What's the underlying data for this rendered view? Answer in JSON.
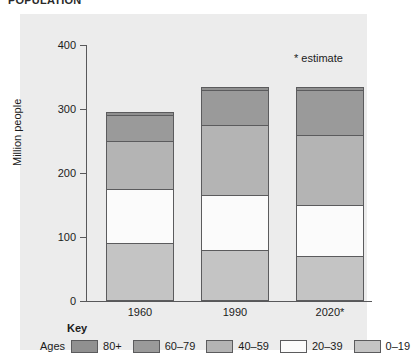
{
  "caption": "POPULATION",
  "chart_data": {
    "type": "bar",
    "subtype": "stacked-bar",
    "title": "",
    "xlabel": "",
    "ylabel": "Million people",
    "ylim": [
      0,
      400
    ],
    "yticks": [
      0,
      100,
      200,
      300,
      400
    ],
    "grid": false,
    "legend_position": "bottom",
    "legend_title": "Key",
    "legend_prefix": "Ages",
    "annotation": "* estimate",
    "categories": [
      "1960",
      "1990",
      "2020*"
    ],
    "series": [
      {
        "name": "0–19",
        "color": "#c4c4c4",
        "values": [
          90,
          80,
          70
        ]
      },
      {
        "name": "20–39",
        "color": "#fbfbfb",
        "values": [
          85,
          85,
          80
        ]
      },
      {
        "name": "40–59",
        "color": "#b4b4b4",
        "values": [
          75,
          110,
          110
        ]
      },
      {
        "name": "60–79",
        "color": "#9a9a9a",
        "values": [
          40,
          55,
          70
        ]
      },
      {
        "name": "80+",
        "color": "#909090",
        "values": [
          5,
          5,
          5
        ]
      }
    ],
    "totals": [
      295,
      335,
      335
    ]
  },
  "colors": {
    "panel_background": "#ececec",
    "page_background": "#ffffff",
    "axis": "#58585a",
    "outline": "#5b5b5d",
    "text": "#1b1b1b"
  }
}
